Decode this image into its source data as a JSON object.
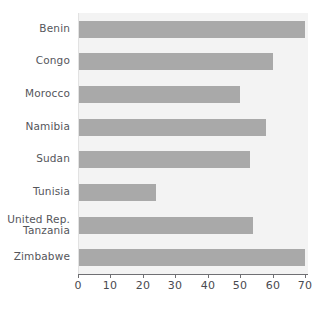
{
  "chart_data": {
    "type": "bar",
    "orientation": "horizontal",
    "title": "",
    "subtitle": "",
    "xlabel": "",
    "ylabel": "",
    "xlim": [
      0,
      70
    ],
    "ylim": null,
    "grid": false,
    "legend": null,
    "legend_position": "none",
    "xticks": [
      0,
      10,
      20,
      30,
      40,
      50,
      60,
      70
    ],
    "xtick_labels": [
      "0",
      "10",
      "20",
      "30",
      "40",
      "50",
      "60",
      "70"
    ],
    "categories": [
      "Benin",
      "Congo",
      "Morocco",
      "Namibia",
      "Sudan",
      "Tunisia",
      "United Rep.\nTanzania",
      "Zimbabwe"
    ],
    "values": [
      70,
      60,
      50,
      58,
      53,
      24,
      54,
      70
    ],
    "bar_color": "#a9a9a9",
    "plot_background": "#f3f3f3",
    "axis_color": "#6f6f73",
    "label_color": "#55565b"
  }
}
